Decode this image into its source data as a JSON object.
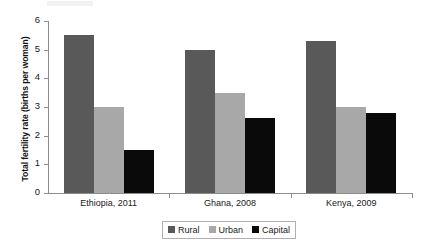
{
  "chart_data": {
    "type": "bar",
    "title": "",
    "subtitle": "",
    "xlabel": "",
    "ylabel": "Total fertility rate (births per woman)",
    "categories": [
      "Ethiopia, 2011",
      "Ghana, 2008",
      "Kenya, 2009"
    ],
    "series": [
      {
        "name": "Rural",
        "color": "#595959",
        "values": [
          5.5,
          5.0,
          5.3
        ]
      },
      {
        "name": "Urban",
        "color": "#a8a8a8",
        "values": [
          3.0,
          3.5,
          3.0
        ]
      },
      {
        "name": "Capital",
        "color": "#0a0a0a",
        "values": [
          1.5,
          2.6,
          2.8
        ]
      }
    ],
    "ylim": [
      0,
      6
    ],
    "yticks": [
      0,
      1,
      2,
      3,
      4,
      5,
      6
    ],
    "ytick_labels": [
      "0",
      "1",
      "2",
      "3",
      "4",
      "5",
      "6"
    ],
    "grid": false,
    "legend_position": "bottom"
  }
}
